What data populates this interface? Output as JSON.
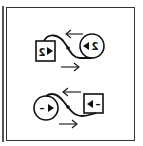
{
  "colors": {
    "stroke": "#111111",
    "frame": "#333333",
    "background": "#ffffff"
  },
  "top_diagram": {
    "square": {
      "label": "2",
      "mirrored": true,
      "arrow_icon": "right-triangle"
    },
    "circle": {
      "label": "2",
      "mirrored": true,
      "arrow_icon": "left-triangle"
    },
    "upper_arrow": "left",
    "lower_arrow": "right"
  },
  "bottom_diagram": {
    "circle": {
      "label": "–",
      "arrow_icon": "right-triangle"
    },
    "square": {
      "label": "–",
      "arrow_icon": "left-triangle"
    },
    "upper_arrow": "left",
    "lower_arrow": "right"
  }
}
